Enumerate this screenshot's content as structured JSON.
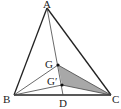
{
  "diagram": {
    "type": "geometry-triangle",
    "points": {
      "A": {
        "label": "A",
        "x": 47,
        "y": 8
      },
      "B": {
        "label": "B",
        "x": 14,
        "y": 95
      },
      "C": {
        "label": "C",
        "x": 111,
        "y": 95
      },
      "D": {
        "label": "D",
        "x": 63,
        "y": 95
      },
      "G": {
        "label": "G",
        "x": 58,
        "y": 65
      },
      "G2": {
        "label": "G′",
        "x": 62,
        "y": 85
      }
    },
    "segments": [
      [
        "A",
        "B"
      ],
      [
        "A",
        "C"
      ],
      [
        "B",
        "C"
      ],
      [
        "A",
        "D"
      ],
      [
        "B",
        "G"
      ],
      [
        "B",
        "G2"
      ],
      [
        "G",
        "C"
      ],
      [
        "G2",
        "C"
      ]
    ],
    "shaded_region": {
      "vertices": [
        "G",
        "G2",
        "C"
      ],
      "color": "#a8a8a8"
    },
    "colors": {
      "stroke": "#222222",
      "thin_stroke": "#444444",
      "fill": "#a8a8a8"
    }
  }
}
